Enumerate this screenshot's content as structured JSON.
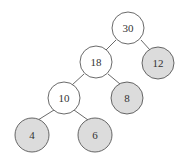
{
  "diagram": {
    "type": "binary-tree",
    "colors": {
      "internal_fill": "#ffffff",
      "leaf_fill": "#dcdcdc",
      "stroke": "#444444"
    },
    "nodes": [
      {
        "id": "n30",
        "label": "30",
        "x": 128,
        "y": 28,
        "leaf": false
      },
      {
        "id": "n18",
        "label": "18",
        "x": 96,
        "y": 62,
        "leaf": false
      },
      {
        "id": "n12",
        "label": "12",
        "x": 158,
        "y": 63,
        "leaf": true
      },
      {
        "id": "n10",
        "label": "10",
        "x": 64,
        "y": 98,
        "leaf": false
      },
      {
        "id": "n8",
        "label": "8",
        "x": 127,
        "y": 98,
        "leaf": true
      },
      {
        "id": "n4",
        "label": "4",
        "x": 32,
        "y": 135,
        "leaf": true
      },
      {
        "id": "n6",
        "label": "6",
        "x": 95,
        "y": 135,
        "leaf": true
      }
    ],
    "edges": [
      [
        "n30",
        "n18"
      ],
      [
        "n30",
        "n12"
      ],
      [
        "n18",
        "n10"
      ],
      [
        "n18",
        "n8"
      ],
      [
        "n10",
        "n4"
      ],
      [
        "n10",
        "n6"
      ]
    ]
  }
}
